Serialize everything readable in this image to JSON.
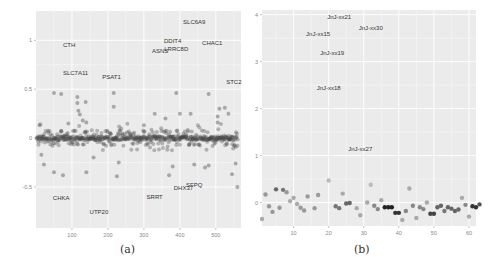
{
  "chart_data": [
    {
      "type": "scatter",
      "panel_label": "(a)",
      "title": "",
      "xlabel": "",
      "ylabel": "",
      "xlim": [
        0,
        570
      ],
      "ylim": [
        -0.92,
        1.3
      ],
      "x_ticks": [
        100,
        200,
        300,
        400,
        500
      ],
      "y_ticks": [
        -0.5,
        0,
        0.5,
        1
      ],
      "y_tick_labels": [
        "-0.5",
        "0",
        "0.5",
        "1"
      ],
      "grid": true,
      "background": "#ebebeb",
      "point_color": "#555555",
      "annotations": [
        {
          "label": "SLC6A9",
          "x": 440,
          "y": 1.17
        },
        {
          "label": "DDIT4",
          "x": 380,
          "y": 0.97
        },
        {
          "label": "CHAC1",
          "x": 490,
          "y": 0.95
        },
        {
          "label": "LRRC8D",
          "x": 390,
          "y": 0.89
        },
        {
          "label": "ASNS",
          "x": 345,
          "y": 0.87
        },
        {
          "label": "CTH",
          "x": 92,
          "y": 0.93
        },
        {
          "label": "SLC7A11",
          "x": 110,
          "y": 0.65
        },
        {
          "label": "PSAT1",
          "x": 210,
          "y": 0.6
        },
        {
          "label": "STC2",
          "x": 550,
          "y": 0.55
        },
        {
          "label": "SFPQ",
          "x": 440,
          "y": -0.5
        },
        {
          "label": "DHX37",
          "x": 410,
          "y": -0.53
        },
        {
          "label": "SRRT",
          "x": 330,
          "y": -0.62
        },
        {
          "label": "CHKA",
          "x": 70,
          "y": -0.63
        },
        {
          "label": "UTP20",
          "x": 175,
          "y": -0.78
        }
      ],
      "values": [
        {
          "x": 10,
          "y": 0.13
        },
        {
          "x": 50,
          "y": 0.46
        },
        {
          "x": 70,
          "y": 0.45
        },
        {
          "x": 90,
          "y": 0.15
        },
        {
          "x": 115,
          "y": 0.42
        },
        {
          "x": 115,
          "y": 0.36
        },
        {
          "x": 118,
          "y": 0.28
        },
        {
          "x": 122,
          "y": 0.24
        },
        {
          "x": 138,
          "y": 0.37
        },
        {
          "x": 130,
          "y": 0.18
        },
        {
          "x": 140,
          "y": 0.16
        },
        {
          "x": 216,
          "y": 0.46
        },
        {
          "x": 216,
          "y": 0.32
        },
        {
          "x": 300,
          "y": 0.13
        },
        {
          "x": 330,
          "y": 0.25
        },
        {
          "x": 360,
          "y": 0.2
        },
        {
          "x": 390,
          "y": 0.46
        },
        {
          "x": 400,
          "y": 0.25
        },
        {
          "x": 430,
          "y": 0.25
        },
        {
          "x": 480,
          "y": 0.45
        },
        {
          "x": 505,
          "y": 0.22
        },
        {
          "x": 510,
          "y": 0.3
        },
        {
          "x": 525,
          "y": 0.31
        },
        {
          "x": 535,
          "y": 0.25
        },
        {
          "x": 505,
          "y": 0.16
        },
        {
          "x": 15,
          "y": -0.17
        },
        {
          "x": 22,
          "y": -0.27
        },
        {
          "x": 50,
          "y": -0.35
        },
        {
          "x": 75,
          "y": -0.38
        },
        {
          "x": 140,
          "y": -0.35
        },
        {
          "x": 160,
          "y": -0.2
        },
        {
          "x": 225,
          "y": -0.39
        },
        {
          "x": 230,
          "y": -0.25
        },
        {
          "x": 370,
          "y": -0.38
        },
        {
          "x": 380,
          "y": -0.29
        },
        {
          "x": 440,
          "y": -0.27
        },
        {
          "x": 470,
          "y": -0.3
        },
        {
          "x": 480,
          "y": -0.28
        },
        {
          "x": 545,
          "y": -0.37
        },
        {
          "x": 560,
          "y": -0.5
        },
        {
          "x": 555,
          "y": -0.26
        }
      ],
      "note": "~560 points, dense cluster near y=0 across all x"
    },
    {
      "type": "scatter",
      "panel_label": "(b)",
      "title": "",
      "xlabel": "",
      "ylabel": "",
      "xlim": [
        1,
        62
      ],
      "ylim": [
        -0.5,
        4.1
      ],
      "x_ticks": [
        10,
        20,
        30,
        40,
        50,
        60
      ],
      "y_ticks": [
        0,
        1,
        2,
        3,
        4
      ],
      "grid": true,
      "background": "#ebebeb",
      "annotations": [
        {
          "label": "JnJ-xx21",
          "x": 23,
          "y": 3.9
        },
        {
          "label": "JnJ-xx30",
          "x": 32,
          "y": 3.68
        },
        {
          "label": "JnJ-xx15",
          "x": 17,
          "y": 3.55
        },
        {
          "label": "JnJ-xx19",
          "x": 21,
          "y": 3.15
        },
        {
          "label": "JnJ-xx18",
          "x": 20,
          "y": 2.4
        },
        {
          "label": "JnJ-xx27",
          "x": 29,
          "y": 1.1
        }
      ],
      "values": [
        {
          "x": 1,
          "y": -0.35,
          "shade": "#aaaaaa"
        },
        {
          "x": 2,
          "y": 0.17,
          "shade": "#999999"
        },
        {
          "x": 3,
          "y": -0.08,
          "shade": "#999999"
        },
        {
          "x": 4,
          "y": -0.2,
          "shade": "#999999"
        },
        {
          "x": 5,
          "y": 0.28,
          "shade": "#666666"
        },
        {
          "x": 6,
          "y": -0.11,
          "shade": "#999999"
        },
        {
          "x": 7,
          "y": 0.27,
          "shade": "#777777"
        },
        {
          "x": 8,
          "y": 0.22,
          "shade": "#999999"
        },
        {
          "x": 9,
          "y": 0.03,
          "shade": "#aaaaaa"
        },
        {
          "x": 10,
          "y": 0.1,
          "shade": "#aaaaaa"
        },
        {
          "x": 11,
          "y": -0.03,
          "shade": "#aaaaaa"
        },
        {
          "x": 12,
          "y": -0.11,
          "shade": "#999999"
        },
        {
          "x": 13,
          "y": -0.17,
          "shade": "#999999"
        },
        {
          "x": 14,
          "y": 0.13,
          "shade": "#999999"
        },
        {
          "x": 16,
          "y": -0.12,
          "shade": "#999999"
        },
        {
          "x": 17,
          "y": 0.16,
          "shade": "#999999"
        },
        {
          "x": 20,
          "y": 0.47,
          "shade": "#bbbbbb"
        },
        {
          "x": 22,
          "y": -0.08,
          "shade": "#777777"
        },
        {
          "x": 23,
          "y": -0.12,
          "shade": "#777777"
        },
        {
          "x": 24,
          "y": 0.19,
          "shade": "#aaaaaa"
        },
        {
          "x": 25,
          "y": -0.02,
          "shade": "#666666"
        },
        {
          "x": 26,
          "y": -0.01,
          "shade": "#666666"
        },
        {
          "x": 28,
          "y": -0.12,
          "shade": "#aaaaaa"
        },
        {
          "x": 29,
          "y": -0.27,
          "shade": "#aaaaaa"
        },
        {
          "x": 31,
          "y": 0.0,
          "shade": "#aaaaaa"
        },
        {
          "x": 32,
          "y": 0.38,
          "shade": "#bbbbbb"
        },
        {
          "x": 33,
          "y": -0.07,
          "shade": "#888888"
        },
        {
          "x": 34,
          "y": -0.14,
          "shade": "#888888"
        },
        {
          "x": 35,
          "y": 0.05,
          "shade": "#aaaaaa"
        },
        {
          "x": 36,
          "y": -0.1,
          "shade": "#222222"
        },
        {
          "x": 37,
          "y": -0.1,
          "shade": "#222222"
        },
        {
          "x": 38,
          "y": -0.1,
          "shade": "#222222"
        },
        {
          "x": 39,
          "y": -0.22,
          "shade": "#333333"
        },
        {
          "x": 40,
          "y": -0.22,
          "shade": "#333333"
        },
        {
          "x": 41,
          "y": -0.37,
          "shade": "#aaaaaa"
        },
        {
          "x": 42,
          "y": -0.18,
          "shade": "#888888"
        },
        {
          "x": 43,
          "y": 0.3,
          "shade": "#aaaaaa"
        },
        {
          "x": 44,
          "y": -0.07,
          "shade": "#888888"
        },
        {
          "x": 45,
          "y": -0.33,
          "shade": "#aaaaaa"
        },
        {
          "x": 46,
          "y": -0.1,
          "shade": "#888888"
        },
        {
          "x": 47,
          "y": -0.14,
          "shade": "#888888"
        },
        {
          "x": 48,
          "y": 0.0,
          "shade": "#aaaaaa"
        },
        {
          "x": 49,
          "y": -0.24,
          "shade": "#444444"
        },
        {
          "x": 50,
          "y": -0.24,
          "shade": "#444444"
        },
        {
          "x": 51,
          "y": -0.1,
          "shade": "#666666"
        },
        {
          "x": 52,
          "y": -0.07,
          "shade": "#666666"
        },
        {
          "x": 53,
          "y": -0.18,
          "shade": "#777777"
        },
        {
          "x": 54,
          "y": -0.1,
          "shade": "#666666"
        },
        {
          "x": 55,
          "y": -0.13,
          "shade": "#666666"
        },
        {
          "x": 56,
          "y": -0.18,
          "shade": "#666666"
        },
        {
          "x": 57,
          "y": -0.15,
          "shade": "#666666"
        },
        {
          "x": 58,
          "y": 0.1,
          "shade": "#aaaaaa"
        },
        {
          "x": 59,
          "y": -0.05,
          "shade": "#888888"
        },
        {
          "x": 60,
          "y": -0.3,
          "shade": "#aaaaaa"
        },
        {
          "x": 61,
          "y": -0.08,
          "shade": "#333333"
        },
        {
          "x": 62,
          "y": -0.1,
          "shade": "#333333"
        },
        {
          "x": 63,
          "y": -0.04,
          "shade": "#555555"
        }
      ]
    }
  ],
  "captions": {
    "a": "(a)",
    "b": "(b)"
  }
}
